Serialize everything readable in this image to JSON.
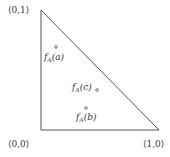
{
  "diagram": {
    "vertices": {
      "top": "⟨0,1⟩",
      "origin": "⟨0,0⟩",
      "right": "⟨1,0⟩"
    },
    "points": [
      {
        "f": "f",
        "sub": "A",
        "arg": "(a)"
      },
      {
        "f": "f",
        "sub": "A",
        "arg": "(c)"
      },
      {
        "f": "f",
        "sub": "A",
        "arg": "(b)"
      }
    ],
    "colors": {
      "line": "#555555",
      "text": "#333333"
    }
  }
}
